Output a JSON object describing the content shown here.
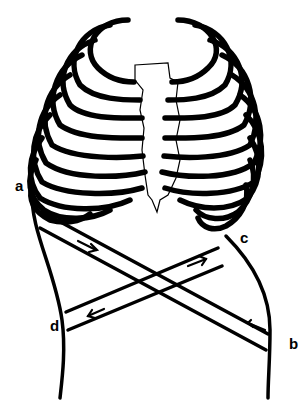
{
  "diagram": {
    "labels": {
      "a": "a",
      "b": "b",
      "c": "c",
      "d": "d"
    },
    "arrows": [
      {
        "band": "a-to-c",
        "direction": "right"
      },
      {
        "band": "c-to-d",
        "direction": "left"
      },
      {
        "band": "b-to-a",
        "direction": "left"
      }
    ],
    "colors": {
      "stroke": "#000000",
      "background": "#ffffff"
    }
  }
}
